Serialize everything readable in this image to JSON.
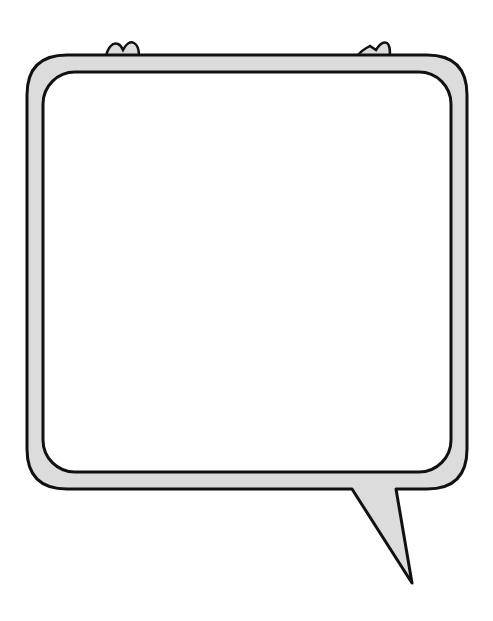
{
  "illustration": {
    "type": "speech-bubble",
    "colors": {
      "frame_fill": "#dcdcdc",
      "outline": "#111111",
      "interior": "#ffffff",
      "background": "#ffffff"
    }
  }
}
